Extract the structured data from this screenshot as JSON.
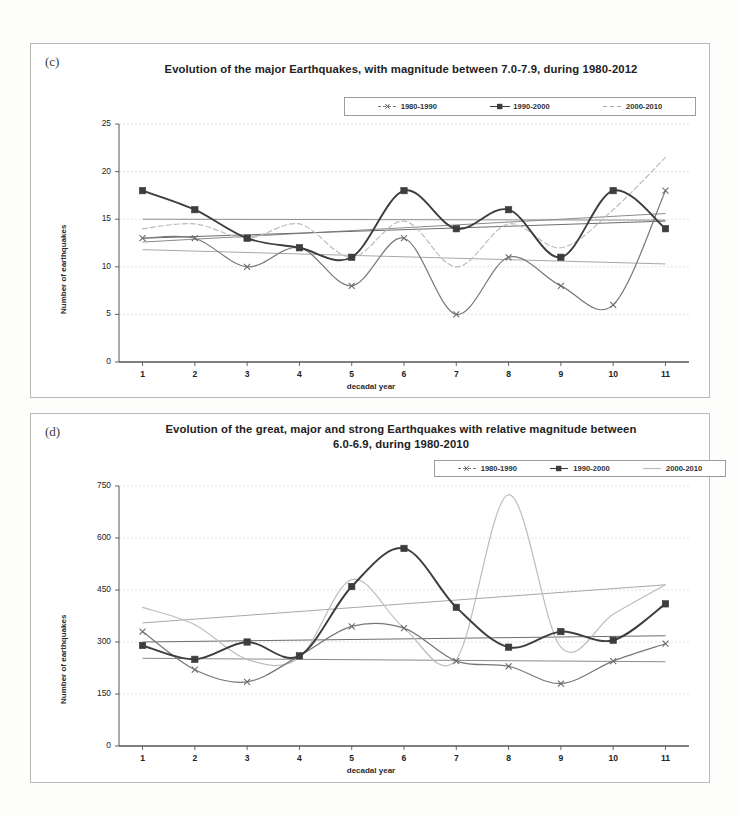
{
  "page": {
    "background": "#fdfdfc",
    "panel_border": "#b9b9b9"
  },
  "colors": {
    "series_1980_1990": "#777777",
    "series_1990_2000": "#3d3d3d",
    "series_2000_2010": "#bdbdbd",
    "trend_1980_1990": "#8a8a8a",
    "trend_1990_2000": "#6e6e6e",
    "trend_2000_2010": "#a8a8a8",
    "gridline": "#d9d9d9",
    "axis": "#555555",
    "text": "#242424"
  },
  "panel_c": {
    "tag": "(c)",
    "title": "Evolution of the major Earthquakes, with magnitude between 7.0-7.9, during 1980-2012",
    "legend": [
      {
        "label": "1980-1990",
        "marker": "cross",
        "style": "dashed"
      },
      {
        "label": "1990-2000",
        "marker": "square",
        "style": "solid"
      },
      {
        "label": "2000-2010",
        "marker": "none",
        "style": "dashed"
      }
    ]
  },
  "panel_d": {
    "tag": "(d)",
    "title": "Evolution of the great, major and strong Earthquakes with relative magnitude between 6.0-6.9, during 1980-2010",
    "title_line1": "Evolution of the great, major and strong Earthquakes with relative magnitude between",
    "title_line2": "6.0-6.9, during 1980-2010",
    "legend": [
      {
        "label": "1980-1990",
        "marker": "cross",
        "style": "dashed"
      },
      {
        "label": "1990-2000",
        "marker": "square",
        "style": "solid"
      },
      {
        "label": "2000-2010",
        "marker": "none",
        "style": "solid"
      }
    ]
  },
  "chart_data": [
    {
      "id": "chart_c",
      "type": "line",
      "title": "Evolution of the major Earthquakes, with magnitude between 7.0-7.9, during 1980-2012",
      "xlabel": "decadal year",
      "ylabel": "Number of earthquakes",
      "x": [
        1,
        2,
        3,
        4,
        5,
        6,
        7,
        8,
        9,
        10,
        11
      ],
      "xticklabels": [
        "1",
        "2",
        "3",
        "4",
        "5",
        "6",
        "7",
        "8",
        "9",
        "10",
        "11"
      ],
      "yticks": [
        0,
        5,
        10,
        15,
        20,
        25
      ],
      "yticklabels": [
        "0",
        "5",
        "10",
        "15",
        "20",
        "25"
      ],
      "ylim": [
        0,
        25
      ],
      "xlim": [
        0.55,
        11.45
      ],
      "grid": true,
      "legend_position": "top-center",
      "smoothing": "spline",
      "series": [
        {
          "name": "1980-1990",
          "marker": "cross",
          "style": "dashed",
          "color": "#777777",
          "values": [
            13,
            13,
            10,
            12,
            8,
            13,
            5,
            11,
            8,
            6,
            18
          ],
          "trend": {
            "start": 12.6,
            "end": 15.6,
            "color": "#8a8a8a"
          }
        },
        {
          "name": "1990-2000",
          "marker": "square",
          "style": "solid",
          "color": "#3d3d3d",
          "values": [
            18,
            16,
            13,
            12,
            11,
            18,
            14,
            16,
            11,
            18,
            14
          ],
          "trend": {
            "start": 13.0,
            "end": 14.8,
            "color": "#6e6e6e"
          }
        },
        {
          "name": "2000-2010",
          "marker": "none",
          "style": "dashed",
          "color": "#bdbdbd",
          "values": [
            14,
            14.5,
            13,
            14.5,
            11,
            14.8,
            10,
            14.5,
            12,
            16,
            21.5
          ],
          "trend": {
            "start": 11.8,
            "end": 10.3,
            "color": "#a8a8a8"
          }
        }
      ],
      "extra_trend_lines": [
        {
          "name": "flat-15",
          "start": 15.0,
          "end": 14.9,
          "color": "#8f8f8f"
        }
      ]
    },
    {
      "id": "chart_d",
      "type": "line",
      "title": "Evolution of the great, major and strong Earthquakes with relative magnitude between 6.0-6.9, during 1980-2010",
      "xlabel": "decadal year",
      "ylabel": "Number of earthquakes",
      "x": [
        1,
        2,
        3,
        4,
        5,
        6,
        7,
        8,
        9,
        10,
        11
      ],
      "xticklabels": [
        "1",
        "2",
        "3",
        "4",
        "5",
        "6",
        "7",
        "8",
        "9",
        "10",
        "11"
      ],
      "yticks": [
        0,
        150,
        300,
        450,
        600,
        750
      ],
      "yticklabels": [
        "0",
        "150",
        "300",
        "450",
        "600",
        "750"
      ],
      "ylim": [
        0,
        750
      ],
      "xlim": [
        0.55,
        11.45
      ],
      "grid": true,
      "legend_position": "top-right",
      "smoothing": "spline",
      "series": [
        {
          "name": "1980-1990",
          "marker": "cross",
          "style": "dashed",
          "color": "#777777",
          "values": [
            330,
            220,
            185,
            260,
            345,
            340,
            245,
            230,
            180,
            245,
            295
          ],
          "trend": {
            "start": 253,
            "end": 243,
            "color": "#8a8a8a"
          }
        },
        {
          "name": "1990-2000",
          "marker": "square",
          "style": "solid",
          "color": "#3d3d3d",
          "values": [
            290,
            250,
            300,
            260,
            460,
            570,
            400,
            285,
            330,
            305,
            410
          ],
          "trend": {
            "start": 300,
            "end": 318,
            "color": "#6e6e6e"
          }
        },
        {
          "name": "2000-2010",
          "marker": "none",
          "style": "solid",
          "color": "#bdbdbd",
          "values": [
            400,
            350,
            250,
            255,
            480,
            340,
            250,
            725,
            285,
            380,
            465
          ],
          "trend": {
            "start": 355,
            "end": 465,
            "color": "#a8a8a8"
          }
        }
      ],
      "extra_trend_lines": []
    }
  ]
}
